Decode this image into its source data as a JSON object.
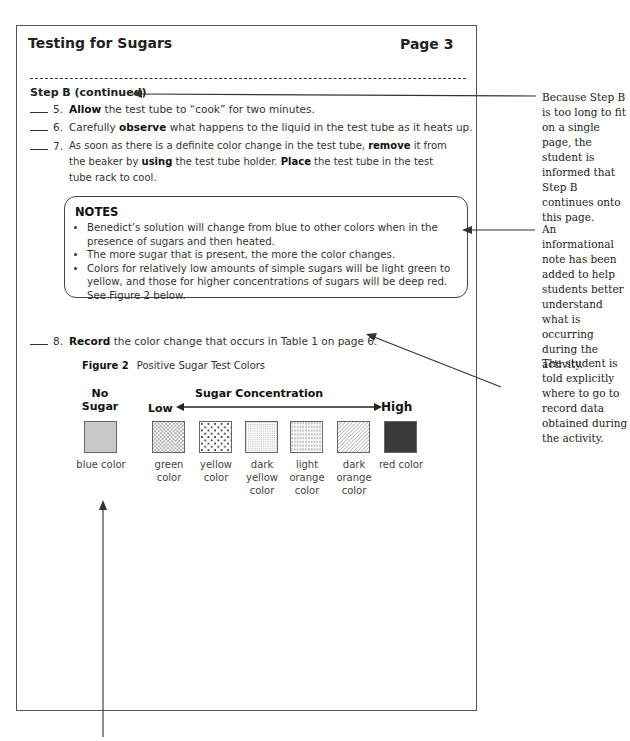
{
  "page": {
    "title": "Testing for Sugars",
    "page_number": "Page 3",
    "section": "Step B (continued)",
    "steps": [
      {
        "num": "5.",
        "parts": [
          {
            "b": "Allow"
          },
          {
            "t": " the test tube to “cook” for two minutes."
          }
        ]
      },
      {
        "num": "6.",
        "parts": [
          {
            "t": "Carefully "
          },
          {
            "b": "observe"
          },
          {
            "t": " what happens to the liquid in the test tube as it heats up."
          }
        ]
      },
      {
        "num": "7.",
        "parts": [
          {
            "t": "As soon as there is a definite color change in the test tube, "
          },
          {
            "b": "remove"
          },
          {
            "t": " it from the beaker by "
          },
          {
            "b": "using"
          },
          {
            "t": " the test tube holder. "
          },
          {
            "b": "Place"
          },
          {
            "t": " the test tube in the test tube rack to cool."
          }
        ]
      },
      {
        "num": "8.",
        "parts": [
          {
            "b": "Record"
          },
          {
            "t": " the color change that occurs in Table 1 on page 6."
          }
        ]
      }
    ],
    "notes": {
      "heading": "NOTES",
      "items": [
        "Benedict’s solution will change from blue to other colors when in the presence of sugars and then heated.",
        "The more sugar that is present, the more the color changes.",
        "Colors for relatively low amounts of simple sugars will be light green to yellow, and those for higher concentrations of sugars will be deep red. See Figure 2 below."
      ]
    },
    "figure": {
      "label": "Figure 2",
      "caption": "Positive Sugar Test Colors",
      "no_sugar_line1": "No",
      "no_sugar_line2": "Sugar",
      "concentration_label": "Sugar Concentration",
      "low_label": "Low",
      "high_label": "High",
      "swatches": [
        {
          "label": "blue color",
          "pattern": "solid-gray"
        },
        {
          "label": "green color",
          "pattern": "crosshatch"
        },
        {
          "label": "yellow color",
          "pattern": "dots"
        },
        {
          "label": "dark yellow color",
          "pattern": "fine-stipple"
        },
        {
          "label": "light orange color",
          "pattern": "vertical-dashes"
        },
        {
          "label": "dark orange color",
          "pattern": "diagonal-lines"
        },
        {
          "label": "red color",
          "pattern": "solid-dark"
        }
      ]
    }
  },
  "annotations": [
    "Because Step B is too long to fit on a single page, the student is informed that Step B continues onto this page.",
    "An informational note has been added to help students better understand what is occurring during the activity.",
    "The student is told explicitly where to go to record data obtained during the activity."
  ]
}
